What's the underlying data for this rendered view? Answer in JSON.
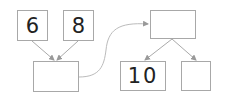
{
  "diagram": {
    "left_tree": {
      "children": [
        {
          "label": "6"
        },
        {
          "label": "8"
        }
      ],
      "parent": {
        "label": ""
      }
    },
    "right_tree": {
      "parent": {
        "label": ""
      },
      "children": [
        {
          "label": "10"
        },
        {
          "label": ""
        }
      ]
    },
    "colors": {
      "border": "#a8a8a8",
      "arrow": "#999999",
      "text": "#222222"
    }
  }
}
